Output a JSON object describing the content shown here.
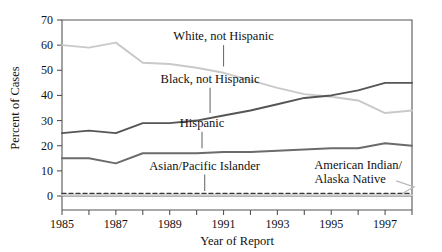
{
  "chart_data": {
    "type": "line",
    "title": "",
    "xlabel": "Year of Report",
    "ylabel": "Percent of Cases",
    "xlim": [
      1985,
      1998
    ],
    "ylim": [
      0,
      70
    ],
    "yticks": [
      0,
      10,
      20,
      30,
      40,
      50,
      60,
      70
    ],
    "xticks": [
      1985,
      1986,
      1987,
      1988,
      1989,
      1990,
      1991,
      1992,
      1993,
      1994,
      1995,
      1996,
      1997,
      1998
    ],
    "xtick_labels": [
      "1985",
      "",
      "1987",
      "",
      "1989",
      "",
      "1991",
      "",
      "1993",
      "",
      "1995",
      "",
      "1997",
      ""
    ],
    "ytick_labels": [
      "0",
      "10",
      "20",
      "30",
      "40",
      "50",
      "60",
      "70"
    ],
    "grid": false,
    "legend": "inline-annotations",
    "x": [
      1985,
      1986,
      1987,
      1988,
      1989,
      1990,
      1991,
      1992,
      1993,
      1994,
      1995,
      1996,
      1997,
      1998
    ],
    "series": [
      {
        "name": "White, not Hispanic",
        "color": "#c9c9c9",
        "style": "solid",
        "values": [
          60,
          59,
          61,
          53,
          52.5,
          51,
          49,
          46,
          43,
          40.5,
          39.5,
          38,
          33,
          34
        ]
      },
      {
        "name": "Black, not Hispanic",
        "color": "#555555",
        "style": "solid",
        "values": [
          25,
          26,
          25,
          29,
          29,
          30,
          32,
          34,
          36.5,
          39,
          40,
          42,
          45,
          45
        ]
      },
      {
        "name": "Hispanic",
        "color": "#6b6b6b",
        "style": "solid",
        "values": [
          15,
          15,
          13,
          17,
          17,
          17,
          17.5,
          17.5,
          18,
          18.5,
          19,
          19,
          21,
          20
        ]
      },
      {
        "name": "Asian/Pacific Islander",
        "color": "#3a3a3a",
        "style": "dashed",
        "values": [
          1,
          1,
          1,
          1,
          1,
          1,
          1,
          1,
          1,
          1,
          1,
          1,
          1,
          1
        ]
      },
      {
        "name": "American Indian/Alaska Native",
        "color": "#cccccc",
        "style": "solid",
        "values": [
          0.3,
          0.3,
          0.3,
          0.3,
          0.3,
          0.3,
          0.3,
          0.3,
          0.3,
          0.3,
          0.3,
          0.3,
          0.3,
          0.3
        ]
      }
    ],
    "annotations": [
      {
        "text": "White, not Hispanic",
        "x": 1991.0,
        "y": 62.0,
        "leader_to_y": 51.5
      },
      {
        "text": "Black, not Hispanic",
        "x": 1990.5,
        "y": 45.0,
        "leader_to_y": 33.0
      },
      {
        "text": "Hispanic",
        "x": 1990.2,
        "y": 27.5,
        "leader_to_y": 19.0
      },
      {
        "text": "Asian/Pacific Islander",
        "x": 1990.3,
        "y": 10.5,
        "leader_to_y": 2.0
      },
      {
        "text": "American Indian/ Alaska Native",
        "x": 1996.0,
        "y": 10.0,
        "leader_to_y": 1.0
      }
    ]
  },
  "axes": {
    "ylabel": "Percent of Cases",
    "xlabel": "Year of Report"
  },
  "labels": {
    "white": "White, not Hispanic",
    "black": "Black, not Hispanic",
    "hispanic": "Hispanic",
    "asian": "Asian/Pacific Islander",
    "amind_line1": "American Indian/",
    "amind_line2": "Alaska Native"
  }
}
